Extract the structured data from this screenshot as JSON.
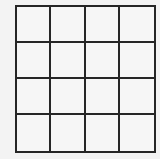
{
  "grid": {
    "rows": 4,
    "columns": 4,
    "line_color": "#262626",
    "background_color": "#f3f3f3",
    "cells": [
      [
        "",
        "",
        "",
        ""
      ],
      [
        "",
        "",
        "",
        ""
      ],
      [
        "",
        "",
        "",
        ""
      ],
      [
        "",
        "",
        "",
        ""
      ]
    ]
  }
}
